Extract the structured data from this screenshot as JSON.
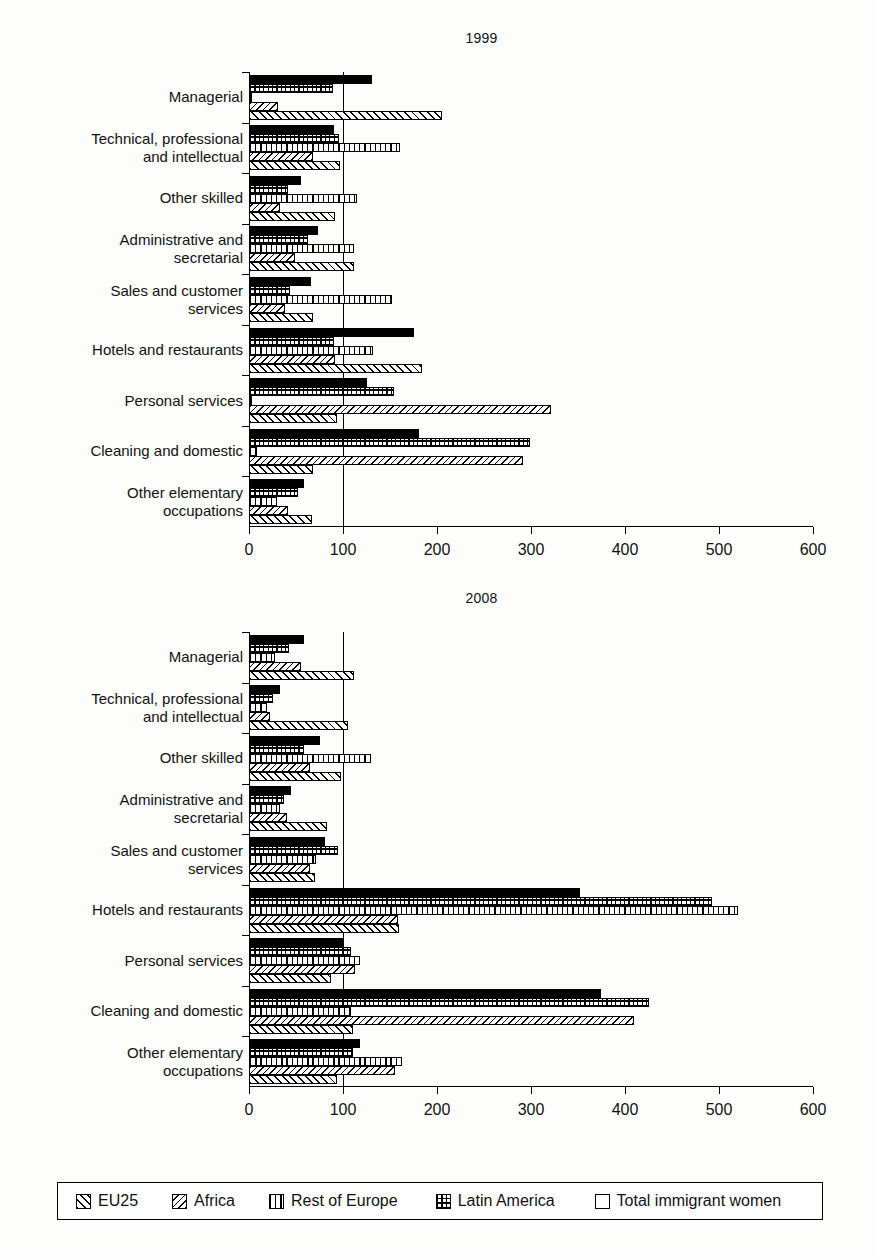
{
  "chart_data": {
    "type": "bar",
    "orientation": "horizontal",
    "title": "",
    "panels": [
      {
        "title": "1999",
        "xlabel": "",
        "ylabel": "",
        "xlim": [
          0,
          600
        ],
        "xticks": [
          0,
          100,
          200,
          300,
          400,
          500,
          600
        ],
        "xtick_labels": [
          "0",
          "100",
          "200",
          "300",
          "400",
          "500",
          "600"
        ],
        "reference_line": 100,
        "grid": false,
        "categories": [
          "Managerial",
          "Technical, professional\nand intellectual",
          "Other skilled",
          "Administrative and\nsecretarial",
          "Sales and customer\nservices",
          "Hotels and restaurants",
          "Personal services",
          "Cleaning and domestic",
          "Other elementary\noccupations"
        ],
        "series": [
          {
            "name": "Total immigrant women",
            "pattern": "solid-black",
            "values": [
              131,
              90,
              55,
              73,
              66,
              175,
              126,
              181,
              59
            ]
          },
          {
            "name": "Latin America",
            "pattern": "dotted-grid",
            "values": [
              89,
              96,
              41,
              63,
              44,
              90,
              154,
              299,
              52
            ]
          },
          {
            "name": "Rest of Europe",
            "pattern": "vertical-lines",
            "values": [
              3,
              161,
              115,
              112,
              152,
              132,
              3,
              8,
              30
            ]
          },
          {
            "name": "Africa",
            "pattern": "fine-diagonal",
            "values": [
              31,
              68,
              33,
              49,
              38,
              91,
              321,
              291,
              41
            ]
          },
          {
            "name": "EU25",
            "pattern": "wide-diagonal",
            "values": [
              205,
              97,
              91,
              112,
              68,
              184,
              94,
              68,
              67
            ]
          }
        ]
      },
      {
        "title": "2008",
        "xlabel": "",
        "ylabel": "",
        "xlim": [
          0,
          600
        ],
        "xticks": [
          0,
          100,
          200,
          300,
          400,
          500,
          600
        ],
        "xtick_labels": [
          "0",
          "100",
          "200",
          "300",
          "400",
          "500",
          "600"
        ],
        "reference_line": 100,
        "grid": false,
        "categories": [
          "Managerial",
          "Technical, professional\nand intellectual",
          "Other skilled",
          "Administrative and\nsecretarial",
          "Sales and customer\nservices",
          "Hotels and restaurants",
          "Personal services",
          "Cleaning and domestic",
          "Other elementary\noccupations"
        ],
        "series": [
          {
            "name": "Total immigrant women",
            "pattern": "solid-black",
            "values": [
              59,
              33,
              76,
              45,
              81,
              352,
              100,
              374,
              118
            ]
          },
          {
            "name": "Latin America",
            "pattern": "dotted-grid",
            "values": [
              43,
              25,
              58,
              37,
              95,
              493,
              108,
              425,
              111
            ]
          },
          {
            "name": "Rest of Europe",
            "pattern": "vertical-lines",
            "values": [
              28,
              19,
              130,
              33,
              71,
              520,
              118,
              108,
              163
            ]
          },
          {
            "name": "Africa",
            "pattern": "fine-diagonal",
            "values": [
              55,
              22,
              65,
              40,
              65,
              158,
              113,
              410,
              155
            ]
          },
          {
            "name": "EU25",
            "pattern": "wide-diagonal",
            "values": [
              112,
              105,
              98,
              83,
              70,
              160,
              87,
              111,
              94
            ]
          }
        ]
      }
    ],
    "legend": {
      "position": "bottom",
      "entries": [
        {
          "label": "EU25",
          "pattern": "wide-diagonal"
        },
        {
          "label": "Africa",
          "pattern": "fine-diagonal"
        },
        {
          "label": "Rest of Europe",
          "pattern": "vertical-lines"
        },
        {
          "label": "Latin America",
          "pattern": "dotted-grid"
        },
        {
          "label": "Total immigrant women",
          "pattern": "solid-black"
        }
      ]
    }
  },
  "panel_1999": {
    "title": "1999"
  },
  "panel_2008": {
    "title": "2008"
  }
}
